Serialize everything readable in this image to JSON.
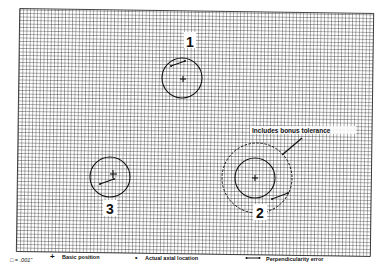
{
  "diagram": {
    "grid": {
      "spacing_px": 3.5,
      "line_color": "#1a1a1a",
      "background": "#ffffff"
    },
    "features": [
      {
        "id": "1",
        "label": "1",
        "tolerance_zone": "circle",
        "basic_position": "cross",
        "error_vector": "perpendicularity-error"
      },
      {
        "id": "2",
        "label": "2",
        "tolerance_zone": "circle",
        "bonus_zone": "dashed-circle",
        "basic_position": "cross",
        "error_vector": "perpendicularity-error"
      },
      {
        "id": "3",
        "label": "3",
        "tolerance_zone": "circle",
        "basic_position": "cross",
        "error_vector": "perpendicularity-error"
      }
    ],
    "annotation": {
      "text": "Includes bonus tolerance"
    },
    "legend": {
      "scale": "□ = .001\"",
      "basic_position_symbol": "+",
      "basic_position": "Basic position",
      "actual_axial_location_symbol": "•",
      "actual_axial_location": "Actual axial location",
      "perpendicularity_error": "Perpendicularity error"
    }
  }
}
